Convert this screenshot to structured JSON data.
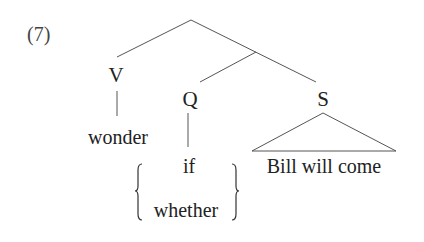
{
  "example_number": "(7)",
  "tree": {
    "root": {
      "label": "",
      "children": [
        "V",
        "branch"
      ]
    },
    "nodes": {
      "V": {
        "label": "V",
        "terminal": "wonder"
      },
      "Q": {
        "label": "Q",
        "terminal_options": [
          "if",
          "whether"
        ]
      },
      "S": {
        "label": "S",
        "terminal": "Bill will come",
        "collapsed": true
      }
    }
  },
  "labels": {
    "V": "V",
    "Q": "Q",
    "S": "S",
    "wonder": "wonder",
    "if": "if",
    "whether": "whether",
    "s_terminal": "Bill will come"
  },
  "colors": {
    "text": "#222222",
    "lines": "#555555",
    "background": "#ffffff"
  }
}
